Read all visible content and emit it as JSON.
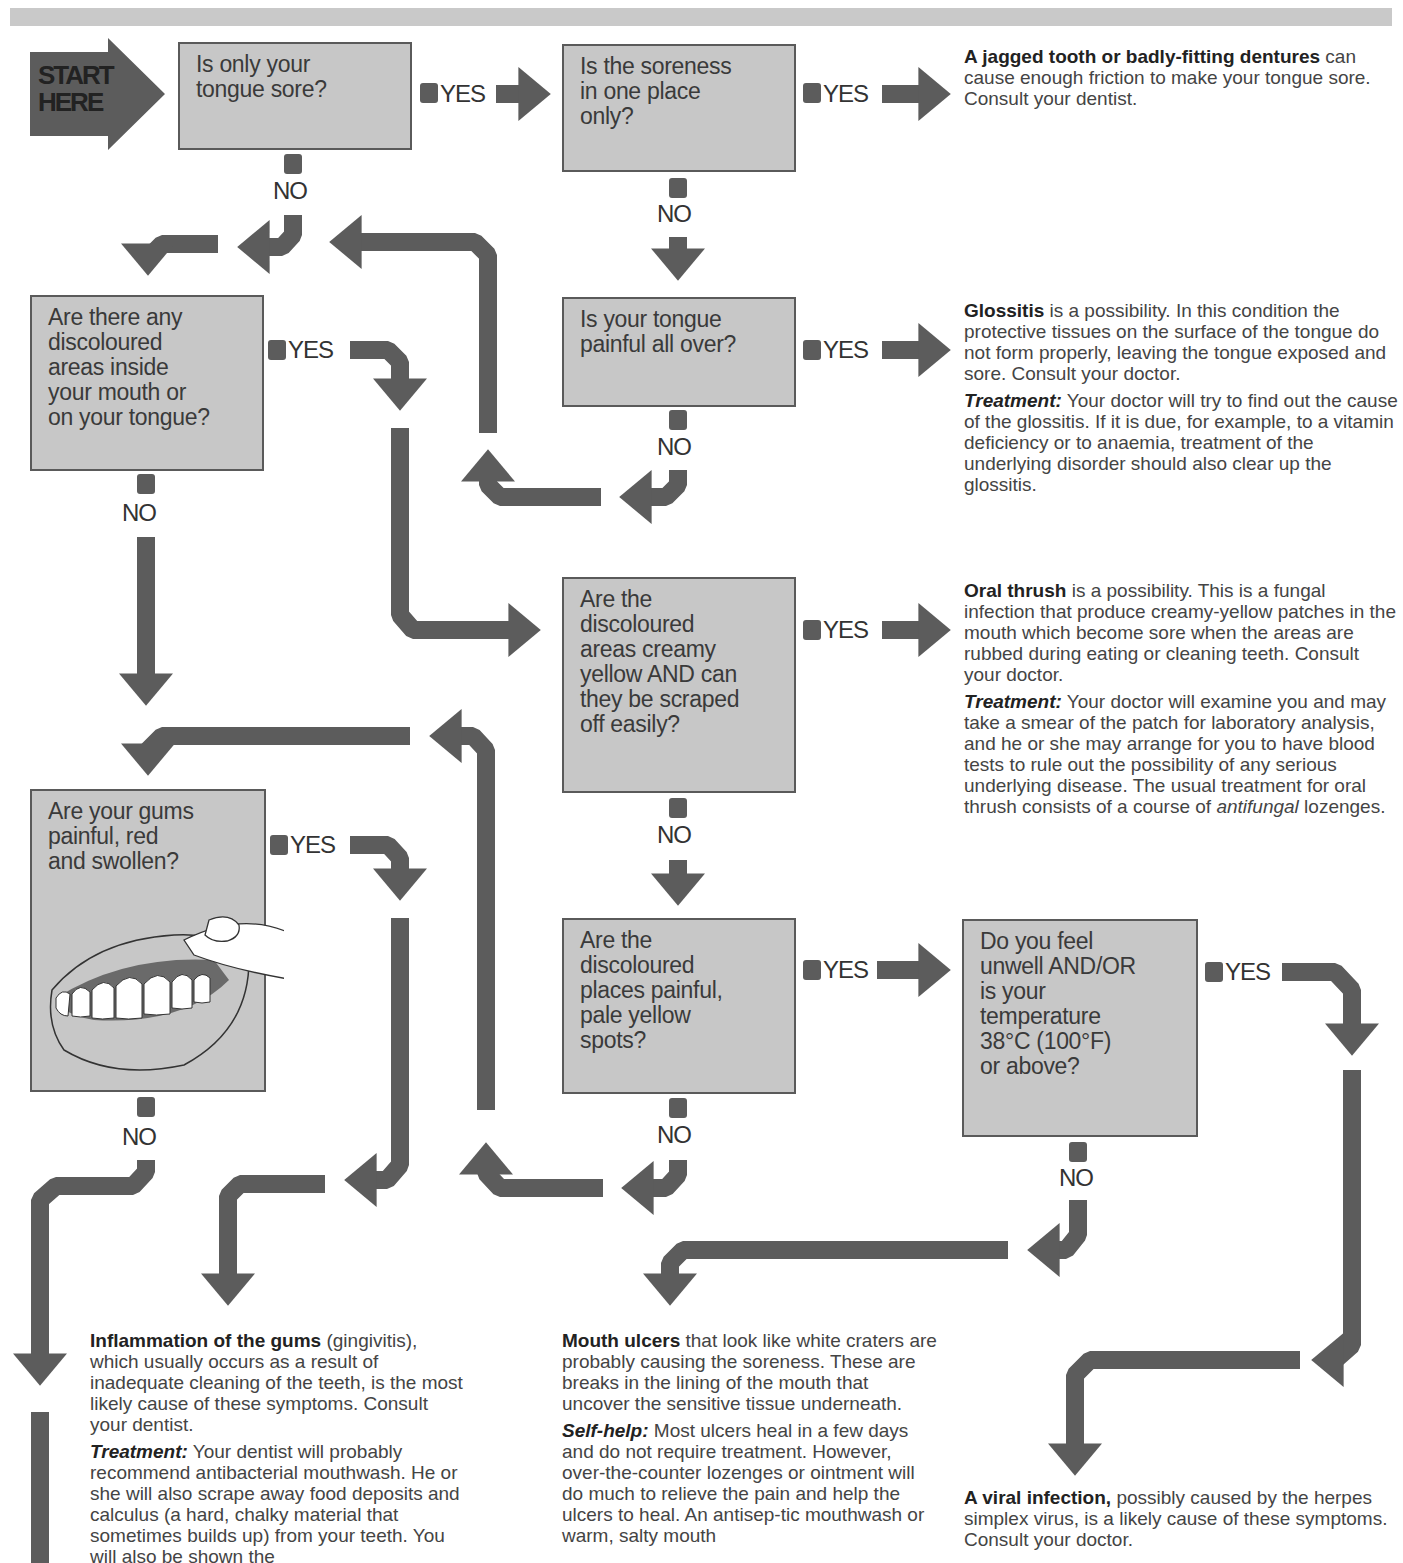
{
  "start": {
    "label": "START\nHERE"
  },
  "connectors": {
    "yes": "YES",
    "no": "NO"
  },
  "questions": [
    {
      "id": "q1",
      "text": "Is only your\ntongue sore?"
    },
    {
      "id": "q2",
      "text": "Is the soreness\nin one place\nonly?"
    },
    {
      "id": "q3",
      "text": "Are there any\ndiscoloured\nareas inside\nyour mouth or\non your tongue?"
    },
    {
      "id": "q4",
      "text": "Is your tongue\npainful all over?"
    },
    {
      "id": "q5",
      "text": "Are the\ndiscoloured\nareas creamy\nyellow AND can\nthey be scraped\noff easily?"
    },
    {
      "id": "q6",
      "text": "Are your gums\npainful, red\nand swollen?"
    },
    {
      "id": "q7",
      "text": "Are the\ndiscoloured\nplaces painful,\npale yellow\nspots?"
    },
    {
      "id": "q8",
      "text": "Do you feel\nunwell AND/OR\nis your\ntemperature\n38°C (100°F)\nor above?"
    }
  ],
  "outcomes": {
    "jagged_tooth": {
      "lead": "A jagged tooth or badly-fitting dentures",
      "body": " can cause enough friction to make your tongue sore. Consult your dentist."
    },
    "glossitis": {
      "lead": "Glossitis",
      "body": " is a possibility. In this condition the protective tissues on the surface of the tongue do not form properly, leaving the tongue exposed and sore. Consult your doctor.",
      "treatment_label": "Treatment:",
      "treatment": " Your doctor will try to find out the cause of the glossitis. If it is due, for example, to a vitamin deficiency or to anaemia, treatment of the underlying disorder should also clear up the glossitis."
    },
    "oral_thrush": {
      "lead": "Oral thrush",
      "body": " is a possibility. This is a fungal infection that produce creamy-yellow patches in the mouth which become sore when the areas are rubbed during eating or cleaning teeth. Consult your doctor.",
      "treatment_label": "Treatment:",
      "treatment": " Your doctor will examine you and may take a smear of the patch for laboratory analysis, and he or she may arrange for you to have blood tests to rule out the possibility of any serious underlying disease. The usual treatment for oral thrush consists of a course of ",
      "treatment_italic": "antifungal",
      "treatment_end": " lozenges."
    },
    "gingivitis": {
      "lead": "Inflammation of the gums",
      "body": " (gingivitis), which usually occurs as a result of inadequate cleaning of the teeth, is the most likely cause of these symptoms. Consult your dentist.",
      "treatment_label": "Treatment:",
      "treatment": " Your dentist will probably recommend antibacterial mouthwash. He or she will also scrape away food deposits and calculus (a hard, chalky material that sometimes builds up) from your teeth. You will also be shown the"
    },
    "mouth_ulcers": {
      "lead": "Mouth ulcers",
      "body": " that look like white craters are probably causing the soreness. These are breaks in the lining of the mouth that uncover the sensitive tissue underneath.",
      "selfhelp_label": "Self-help:",
      "selfhelp": " Most ulcers heal in a few days and do not require treatment. However, over-the-counter lozenges or ointment will do much to relieve the pain and help the ulcers to heal. An antisep-tic mouthwash or warm, salty mouth"
    },
    "viral_infection": {
      "lead": "A viral infection,",
      "body": " possibly caused by the herpes simplex virus, is a likely cause of these symptoms. Consult your doctor."
    }
  },
  "colors": {
    "arrow": "#5c5c5c",
    "box_fill": "#c7c7c7",
    "box_border": "#5a5a5a",
    "band": "#c9c9c9"
  }
}
